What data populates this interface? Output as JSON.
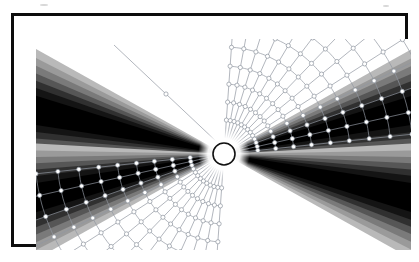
{
  "figure": {
    "title": "",
    "caption": "",
    "frame": {
      "border_color": "#0c0c0c",
      "border_width_px": 3,
      "background_color": "#ffffff",
      "x": 11,
      "y": 13,
      "width": 397,
      "height": 234
    },
    "canvas": {
      "x": 22,
      "y": 23,
      "width": 375,
      "height": 214,
      "background_color": "#ffffff"
    }
  },
  "chart_data": {
    "type": "scatter",
    "title": "",
    "subtitle": "",
    "xlabel": "",
    "ylabel": "",
    "grid": true,
    "legend_position": "none",
    "xlim": [
      0,
      375
    ],
    "ylim": [
      0,
      214
    ],
    "center": {
      "x": 188,
      "y": 115,
      "radius": 11
    },
    "center_style": {
      "fill": "#ffffff",
      "stroke": "#101010",
      "stroke_width": 1.6
    },
    "wedges": [
      {
        "name": "left-upper-wedge",
        "side": "left",
        "bands": [
          {
            "level": 1,
            "color": "#b9b9b9",
            "offset": 0
          },
          {
            "level": 2,
            "color": "#9a9a9a",
            "offset": 9
          },
          {
            "level": 3,
            "color": "#7a7a7a",
            "offset": 17
          },
          {
            "level": 4,
            "color": "#565656",
            "offset": 25
          },
          {
            "level": 5,
            "color": "#303030",
            "offset": 33
          },
          {
            "level": 6,
            "color": "#141414",
            "offset": 41
          },
          {
            "level": 7,
            "color": "#000000",
            "offset": 50
          }
        ]
      },
      {
        "name": "left-lower-wedge",
        "side": "left",
        "bands": [
          {
            "level": 1,
            "color": "#b9b9b9",
            "offset": 0
          },
          {
            "level": 2,
            "color": "#9a9a9a",
            "offset": 9
          },
          {
            "level": 3,
            "color": "#7a7a7a",
            "offset": 17
          },
          {
            "level": 4,
            "color": "#565656",
            "offset": 25
          },
          {
            "level": 5,
            "color": "#303030",
            "offset": 33
          },
          {
            "level": 6,
            "color": "#141414",
            "offset": 41
          },
          {
            "level": 7,
            "color": "#000000",
            "offset": 50
          }
        ]
      },
      {
        "name": "right-upper-wedge",
        "side": "right",
        "bands": [
          {
            "level": 1,
            "color": "#b9b9b9",
            "offset": 0
          },
          {
            "level": 2,
            "color": "#9a9a9a",
            "offset": 9
          },
          {
            "level": 3,
            "color": "#7a7a7a",
            "offset": 17
          },
          {
            "level": 4,
            "color": "#565656",
            "offset": 25
          },
          {
            "level": 5,
            "color": "#303030",
            "offset": 33
          },
          {
            "level": 6,
            "color": "#141414",
            "offset": 41
          },
          {
            "level": 7,
            "color": "#000000",
            "offset": 50
          }
        ]
      },
      {
        "name": "right-lower-wedge",
        "side": "right",
        "bands": [
          {
            "level": 1,
            "color": "#b9b9b9",
            "offset": 0
          },
          {
            "level": 2,
            "color": "#9a9a9a",
            "offset": 9
          },
          {
            "level": 3,
            "color": "#7a7a7a",
            "offset": 17
          },
          {
            "level": 4,
            "color": "#565656",
            "offset": 25
          },
          {
            "level": 5,
            "color": "#303030",
            "offset": 33
          },
          {
            "level": 6,
            "color": "#141414",
            "offset": 41
          },
          {
            "level": 7,
            "color": "#000000",
            "offset": 50
          }
        ]
      }
    ],
    "ray_grid": {
      "line_color": "#9097a0",
      "line_width": 0.7,
      "marker_shape": "circle",
      "marker_radius": 2.1,
      "marker_fill": "#ffffff",
      "marker_stroke": "#8d949d",
      "upper_right": {
        "radial_count": 13,
        "angle_start_deg": -86,
        "angle_end_deg": -6,
        "arc_count": 11,
        "arc_radii": [
          34,
          52,
          70,
          88,
          107,
          126,
          146,
          167,
          189,
          212,
          236
        ]
      },
      "lower_left": {
        "radial_count": 13,
        "angle_start_deg": 94,
        "angle_end_deg": 174,
        "arc_count": 11,
        "arc_radii": [
          34,
          52,
          70,
          88,
          107,
          126,
          146,
          167,
          189,
          212,
          236
        ]
      }
    },
    "stray_rays": [
      {
        "name": "upper-left-stray-ray",
        "x1": 78,
        "y1": 6,
        "x2": 182,
        "y2": 104
      }
    ]
  }
}
